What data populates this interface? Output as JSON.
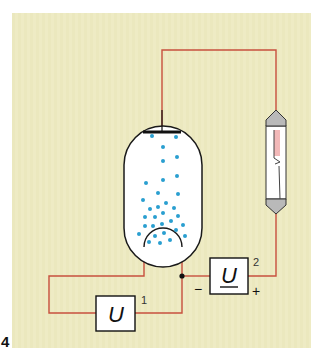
{
  "figure": {
    "number": "4",
    "background_color": "#eeebc4",
    "wire_color": "#c8503e",
    "tube_outline_color": "#1a1a1a",
    "electron_color": "#2a9fd0",
    "lamp_cap_color": "#b9b9b9",
    "lamp_glow_color": "#f2b8b8"
  },
  "components": {
    "source1": {
      "symbol": "U",
      "index": "1"
    },
    "source2": {
      "symbol": "U",
      "index": "2",
      "minus": "−",
      "plus": "+"
    },
    "tube": {
      "label": "electron tube (diode)"
    },
    "lamp": {
      "label": "glow lamp"
    }
  }
}
